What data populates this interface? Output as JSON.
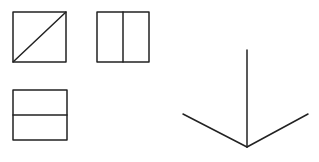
{
  "diagram": {
    "canvas": {
      "width": 319,
      "height": 162,
      "background": "#ffffff"
    },
    "stroke_color": "#222222",
    "stroke_width": 1.5,
    "shapes": [
      {
        "id": "square-diagonal",
        "type": "square-with-diagonal",
        "x": 13,
        "y": 12,
        "w": 53,
        "h": 50,
        "divider": "diagonal bottom-left to top-right"
      },
      {
        "id": "square-vertical-split",
        "type": "square-with-vertical-divider",
        "x": 97,
        "y": 12,
        "w": 52,
        "h": 50,
        "divider_x": 123
      },
      {
        "id": "rect-horizontal-split",
        "type": "rect-with-horizontal-divider",
        "x": 13,
        "y": 90,
        "w": 54,
        "h": 50,
        "divider_y": 115
      },
      {
        "id": "arrow-y-shape",
        "type": "three-line-junction",
        "vertex": [
          247,
          147
        ],
        "ends": [
          [
            247,
            50
          ],
          [
            183,
            114
          ],
          [
            308,
            114
          ]
        ]
      }
    ]
  }
}
